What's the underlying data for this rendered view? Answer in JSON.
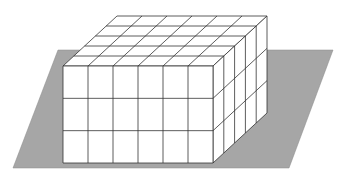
{
  "diagram": {
    "title": "",
    "prism": {
      "length": 6,
      "width": 5,
      "height": 3
    },
    "colors": {
      "plane": "#a6a6a6",
      "cube_face": "#ffffff",
      "edge": "#333333",
      "background": "#ffffff"
    }
  }
}
